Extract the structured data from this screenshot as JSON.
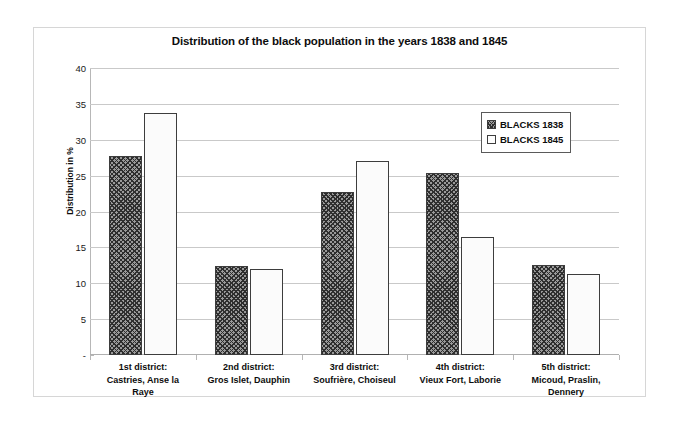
{
  "chart_data": {
    "type": "bar",
    "title": "Distribution of the black population in the years 1838 and 1845",
    "xlabel": "",
    "ylabel": "Distribution in %",
    "ylim": [
      0,
      40
    ],
    "yticks": [
      "-",
      "5",
      "10",
      "15",
      "20",
      "25",
      "30",
      "35",
      "40"
    ],
    "ytick_values": [
      0,
      5,
      10,
      15,
      20,
      25,
      30,
      35,
      40
    ],
    "grid": true,
    "legend_position": "upper right",
    "categories": [
      "1st district:\nCastries, Anse la Raye",
      "2nd district:\nGros Islet, Dauphin",
      "3rd district:\nSoufrière, Choiseul",
      "4th district:\nVieux Fort, Laborie",
      "5th district:\nMicoud, Praslin, Dennery"
    ],
    "category_lines": [
      [
        "1st district:",
        "Castries, Anse la",
        "Raye"
      ],
      [
        "2nd district:",
        "Gros Islet, Dauphin"
      ],
      [
        "3rd district:",
        "Soufrière, Choiseul"
      ],
      [
        "4th district:",
        "Vieux Fort, Laborie"
      ],
      [
        "5th district:",
        "Micoud, Praslin,",
        "Dennery"
      ]
    ],
    "series": [
      {
        "name": "BLACKS 1838",
        "pattern": "diagonal-hatch",
        "color": "#9a9a9a",
        "values": [
          27.8,
          12.4,
          22.7,
          25.3,
          12.6
        ]
      },
      {
        "name": "BLACKS 1845",
        "pattern": "dotted",
        "color": "#fbfbfb",
        "values": [
          33.7,
          12.0,
          27.0,
          16.5,
          11.3
        ]
      }
    ]
  },
  "legend": {
    "entries": [
      {
        "label": "BLACKS 1838"
      },
      {
        "label": "BLACKS 1845"
      }
    ]
  },
  "colors": {
    "frame_border": "#d6d6d6",
    "gridline": "#c9c9c9",
    "axis": "#b7b7b7",
    "bar_outline": "#3d3d3d",
    "text": "#0d0d0d"
  }
}
